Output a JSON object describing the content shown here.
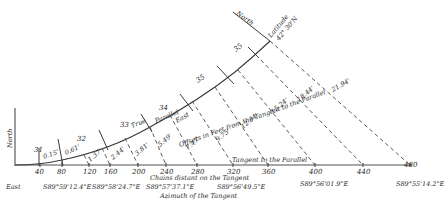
{
  "diagram": {
    "axis_labels": {
      "north_vertical": "North",
      "north_diagonal": "North",
      "east": "East",
      "latitude": "Latitude",
      "latitude_value": "42° 30'N",
      "tangent": "Tangent to the Parallel",
      "chains": "Chains distant on the Tangent",
      "azimuth": "Azimuth of the Tangent",
      "offsets": "Offsets in Feet from the Tangent to the Parallel",
      "true_parallel_1": "True",
      "true_parallel_2": "Parallel",
      "true_parallel_3": "East"
    },
    "chain_ticks": [
      "40",
      "80",
      "120",
      "160",
      "200",
      "240",
      "280",
      "320",
      "360",
      "400",
      "440",
      "480"
    ],
    "range_numbers": [
      "31",
      "32",
      "33",
      "34",
      "35",
      "35",
      "36"
    ],
    "offsets": [
      "0.15'",
      "0.61'",
      "1.37'",
      "2.44'",
      "3.81'",
      "5.49'",
      "7.47'",
      "9.75'",
      "12.34'",
      "15.24'",
      "18.44'",
      "21.94'"
    ],
    "azimuths": [
      "S89°59'12.4\"E",
      "S89°58'24.7\"E",
      "S89°57'37.1\"E",
      "S89°56'49.5\"E",
      "S89°56'01.9\"E",
      "S89°55'14.2\"E"
    ]
  }
}
